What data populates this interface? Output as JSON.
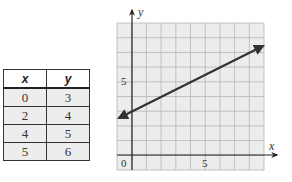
{
  "table": {
    "headers": [
      "x",
      "y"
    ],
    "rows": [
      {
        "x": "0",
        "y": "3"
      },
      {
        "x": "2",
        "y": "4"
      },
      {
        "x": "4",
        "y": "5"
      },
      {
        "x": "5",
        "y": "6"
      }
    ]
  },
  "graph": {
    "x_axis_label": "x",
    "y_axis_label": "y",
    "origin_label": "0",
    "x_tick_label": "5",
    "y_tick_label": "5"
  },
  "chart_data": {
    "type": "line",
    "title": "",
    "xlabel": "x",
    "ylabel": "y",
    "xlim": [
      -1,
      9
    ],
    "ylim": [
      -1,
      9
    ],
    "grid": true,
    "x_ticks": [
      0,
      5
    ],
    "y_ticks": [
      5
    ],
    "series": [
      {
        "name": "y = 0.5x + 3",
        "x": [
          -1,
          0,
          2,
          4,
          5,
          9
        ],
        "y": [
          2.5,
          3,
          4,
          5,
          5.5,
          7.5
        ]
      }
    ],
    "table": {
      "columns": [
        "x",
        "y"
      ],
      "rows": [
        [
          0,
          3
        ],
        [
          2,
          4
        ],
        [
          4,
          5
        ],
        [
          5,
          6
        ]
      ]
    }
  }
}
